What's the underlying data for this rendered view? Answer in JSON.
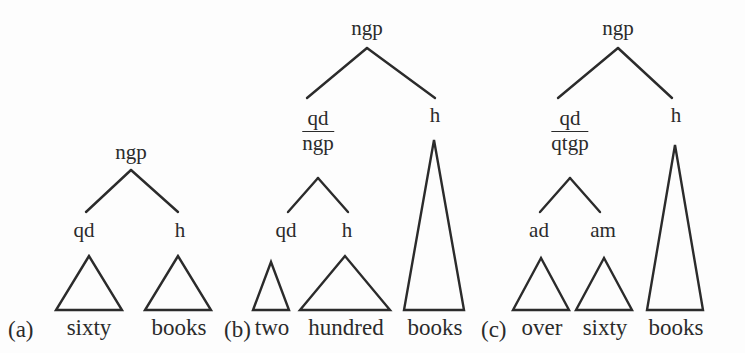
{
  "figure": {
    "background_color": "#fdfdfd",
    "stroke_color": "#2b2b2b",
    "text_color": "#2b2b2b",
    "width": 745,
    "height": 353
  },
  "trees": [
    {
      "id": "a",
      "panel_label": "(a)",
      "panel_label_x": 8,
      "panel_label_y": 318,
      "root": {
        "label": "ngp",
        "x": 131,
        "y": 142
      },
      "children": [
        {
          "label": "qd",
          "x": 84,
          "y": 220
        },
        {
          "label": "h",
          "x": 180,
          "y": 220
        }
      ],
      "branches": [
        {
          "x1": 131,
          "y1": 170,
          "x2": 86,
          "y2": 212
        },
        {
          "x1": 131,
          "y1": 170,
          "x2": 178,
          "y2": 212
        }
      ],
      "triangles": [
        {
          "word": "sixty",
          "apex_x": 89,
          "apex_y": 256,
          "base_y": 310,
          "base_half": 33
        },
        {
          "word": "books",
          "apex_x": 178,
          "apex_y": 256,
          "base_y": 310,
          "base_half": 33
        }
      ],
      "words": [
        {
          "text": "sixty",
          "x": 89,
          "y": 316
        },
        {
          "text": "books",
          "x": 179,
          "y": 316
        }
      ]
    },
    {
      "id": "b",
      "panel_label": "(b)",
      "panel_label_x": 224,
      "panel_label_y": 318,
      "root": {
        "label": "ngp",
        "x": 367,
        "y": 18
      },
      "stacked_node": {
        "numerator": "qd",
        "denominator": "ngp",
        "x": 318,
        "y": 108
      },
      "children": [
        {
          "label": "h",
          "x": 435,
          "y": 105
        },
        {
          "label": "qd",
          "x": 286,
          "y": 220
        },
        {
          "label": "h",
          "x": 347,
          "y": 220
        }
      ],
      "branches": [
        {
          "x1": 367,
          "y1": 48,
          "x2": 307,
          "y2": 98
        },
        {
          "x1": 367,
          "y1": 48,
          "x2": 435,
          "y2": 98
        },
        {
          "x1": 318,
          "y1": 178,
          "x2": 288,
          "y2": 212
        },
        {
          "x1": 318,
          "y1": 178,
          "x2": 348,
          "y2": 212
        }
      ],
      "triangles": [
        {
          "word": "two",
          "apex_x": 271,
          "apex_y": 262,
          "base_y": 310,
          "base_half": 18
        },
        {
          "word": "hundred",
          "apex_x": 345,
          "apex_y": 256,
          "base_y": 310,
          "base_half": 45
        },
        {
          "word": "books",
          "apex_x": 434,
          "apex_y": 140,
          "base_y": 310,
          "base_half": 30
        }
      ],
      "words": [
        {
          "text": "two",
          "x": 272,
          "y": 316
        },
        {
          "text": "hundred",
          "x": 346,
          "y": 316
        },
        {
          "text": "books",
          "x": 435,
          "y": 316
        }
      ]
    },
    {
      "id": "c",
      "panel_label": "(c)",
      "panel_label_x": 481,
      "panel_label_y": 318,
      "root": {
        "label": "ngp",
        "x": 618,
        "y": 18
      },
      "stacked_node": {
        "numerator": "qd",
        "denominator": "qtgp",
        "x": 570,
        "y": 108
      },
      "children": [
        {
          "label": "h",
          "x": 676,
          "y": 105
        },
        {
          "label": "ad",
          "x": 539,
          "y": 220
        },
        {
          "label": "am",
          "x": 603,
          "y": 220
        }
      ],
      "branches": [
        {
          "x1": 618,
          "y1": 48,
          "x2": 558,
          "y2": 98
        },
        {
          "x1": 618,
          "y1": 48,
          "x2": 672,
          "y2": 98
        },
        {
          "x1": 570,
          "y1": 178,
          "x2": 540,
          "y2": 212
        },
        {
          "x1": 570,
          "y1": 178,
          "x2": 600,
          "y2": 212
        }
      ],
      "triangles": [
        {
          "word": "over",
          "apex_x": 541,
          "apex_y": 258,
          "base_y": 310,
          "base_half": 28
        },
        {
          "word": "sixty",
          "apex_x": 604,
          "apex_y": 258,
          "base_y": 310,
          "base_half": 28
        },
        {
          "word": "books",
          "apex_x": 675,
          "apex_y": 145,
          "base_y": 310,
          "base_half": 28
        }
      ],
      "words": [
        {
          "text": "over",
          "x": 542,
          "y": 316
        },
        {
          "text": "sixty",
          "x": 605,
          "y": 316
        },
        {
          "text": "books",
          "x": 676,
          "y": 316
        }
      ]
    }
  ],
  "caption_line": "(a) sixty books (b) two hundred books (c) over sixty books"
}
